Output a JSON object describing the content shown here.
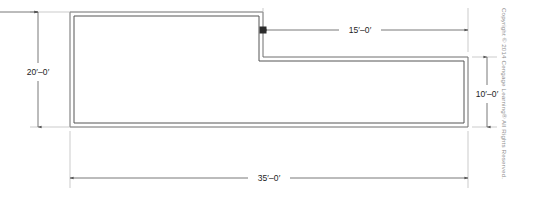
{
  "drawing": {
    "type": "architectural-floor-plan-outline",
    "units": "feet-inches",
    "wall_style": "double-line",
    "line_color": "#4a4a4a",
    "dimension_color": "#6e6e6e",
    "text_color": "#1d1d1d",
    "background_color": "#ffffff",
    "outline_points": [
      [
        70,
        12
      ],
      [
        263,
        12
      ],
      [
        263,
        57
      ],
      [
        468,
        57
      ],
      [
        468,
        127
      ],
      [
        70,
        127
      ]
    ],
    "wall_thickness_px": 4,
    "dimensions": [
      {
        "id": "left-height",
        "label": "20′–0′",
        "orientation": "vertical",
        "position": "left",
        "line_x": 38,
        "from": 12,
        "to": 127,
        "text_x": 38,
        "text_y": 73
      },
      {
        "id": "top-right-width",
        "label": "15′–0′",
        "orientation": "horizontal",
        "position": "top-right",
        "line_y": 30,
        "from": 263,
        "to": 468,
        "text_x": 360,
        "text_y": 33
      },
      {
        "id": "right-height",
        "label": "10′–0′",
        "orientation": "vertical",
        "position": "right",
        "line_x": 487,
        "from": 57,
        "to": 127,
        "text_x": 487,
        "text_y": 95
      },
      {
        "id": "bottom-width",
        "label": "35′–0′",
        "orientation": "horizontal",
        "position": "bottom",
        "line_y": 178,
        "from": 70,
        "to": 468,
        "text_x": 269,
        "text_y": 181
      }
    ]
  },
  "copyright": {
    "text": "Copyright © 2014 Cengage Learning® All Rights Reserved."
  }
}
